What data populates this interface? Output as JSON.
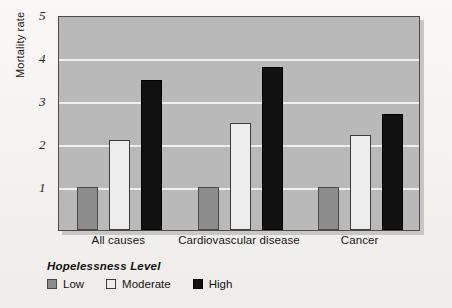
{
  "chart_data": {
    "type": "bar",
    "title": "",
    "xlabel": "",
    "ylabel": "Mortality rate",
    "ylim": [
      0,
      5
    ],
    "yticks": [
      1,
      2,
      3,
      4,
      5
    ],
    "grid": true,
    "legend_position": "bottom-left",
    "legend_title": "Hopelessness Level",
    "categories": [
      "All causes",
      "Cardiovascular disease",
      "Cancer"
    ],
    "series": [
      {
        "name": "Low",
        "color": "#8d8d8d",
        "values": [
          1.0,
          1.0,
          1.0
        ]
      },
      {
        "name": "Moderate",
        "color": "#ededed",
        "values": [
          2.1,
          2.5,
          2.2
        ]
      },
      {
        "name": "High",
        "color": "#111111",
        "values": [
          3.5,
          3.8,
          2.7
        ]
      }
    ]
  },
  "axes": {
    "y_title": "Mortality rate",
    "y_tick_labels": [
      "1",
      "2",
      "3",
      "4",
      "5"
    ]
  },
  "x_axis": {
    "labels": [
      "All causes",
      "Cardiovascular disease",
      "Cancer"
    ]
  },
  "legend": {
    "title": "Hopelessness Level",
    "items": [
      {
        "label": "Low",
        "swatch": "low"
      },
      {
        "label": "Moderate",
        "swatch": "moderate"
      },
      {
        "label": "High",
        "swatch": "high"
      }
    ]
  },
  "colors": {
    "plot_background": "#b9b9b9",
    "page_background": "#f1efec",
    "gridline": "#efefef",
    "low": "#8d8d8d",
    "moderate": "#ededed",
    "high": "#111111"
  }
}
